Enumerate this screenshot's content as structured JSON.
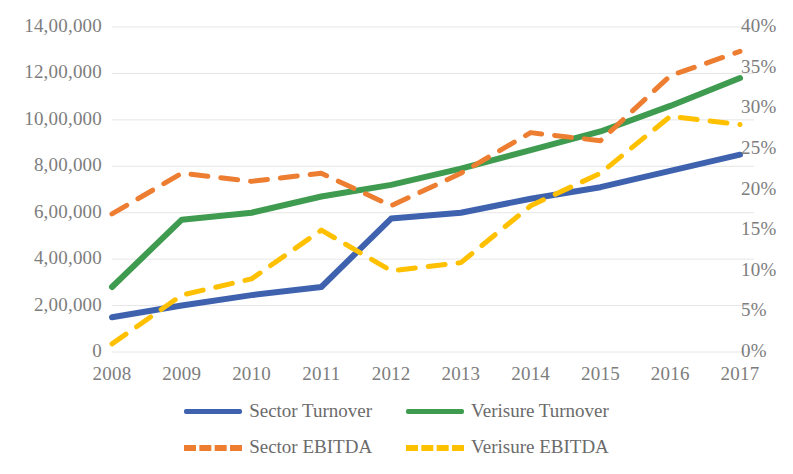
{
  "chart_data": {
    "type": "line",
    "title": "",
    "subtitle": "",
    "xlabel": "",
    "ylabel": "",
    "categories": [
      "2008",
      "2009",
      "2010",
      "2011",
      "2012",
      "2013",
      "2014",
      "2015",
      "2016",
      "2017"
    ],
    "grid": true,
    "legend_position": "bottom",
    "axes": {
      "left": {
        "label": "",
        "ylim": [
          0,
          1400000
        ],
        "tick_step": 200000,
        "tick_labels": [
          "0",
          "2,00,000",
          "4,00,000",
          "6,00,000",
          "8,00,000",
          "10,00,000",
          "12,00,000",
          "14,00,000"
        ],
        "tick_values": [
          0,
          200000,
          400000,
          600000,
          800000,
          1000000,
          1200000,
          1400000
        ],
        "format": "indian-grouping"
      },
      "right": {
        "label": "",
        "ylim": [
          0,
          40
        ],
        "tick_step": 5,
        "tick_labels": [
          "0%",
          "5%",
          "10%",
          "15%",
          "20%",
          "25%",
          "30%",
          "35%",
          "40%"
        ],
        "tick_values": [
          0,
          5,
          10,
          15,
          20,
          25,
          30,
          35,
          40
        ],
        "format": "percent"
      }
    },
    "series": [
      {
        "name": "Sector  Turnover",
        "axis": "left",
        "color": "#3F62AF",
        "style": "solid",
        "width": 6,
        "values": [
          150000,
          200000,
          245000,
          280000,
          575000,
          600000,
          660000,
          710000,
          780000,
          850000
        ]
      },
      {
        "name": "Verisure Turnover",
        "axis": "left",
        "color": "#3E9B4F",
        "style": "solid",
        "width": 6,
        "values": [
          280000,
          570000,
          600000,
          670000,
          720000,
          790000,
          870000,
          950000,
          1060000,
          1180000
        ]
      },
      {
        "name": "Sector EBITDA",
        "axis": "right",
        "color": "#ED7D31",
        "style": "dashed",
        "width": 5,
        "values": [
          17,
          22,
          21,
          22,
          18,
          22,
          27,
          26,
          34,
          37
        ]
      },
      {
        "name": "Verisure EBITDA",
        "axis": "right",
        "color": "#FFC000",
        "style": "dashed",
        "width": 5,
        "values": [
          1,
          7,
          9,
          15,
          10,
          11,
          18,
          22,
          29,
          28
        ]
      }
    ]
  },
  "legend": {
    "rows": [
      [
        {
          "label": "Sector  Turnover",
          "color": "#3F62AF",
          "style": "solid"
        },
        {
          "label": "Verisure Turnover",
          "color": "#3E9B4F",
          "style": "solid"
        }
      ],
      [
        {
          "label": "Sector EBITDA",
          "color": "#ED7D31",
          "style": "dashed"
        },
        {
          "label": "Verisure EBITDA",
          "color": "#FFC000",
          "style": "dashed"
        }
      ]
    ]
  }
}
